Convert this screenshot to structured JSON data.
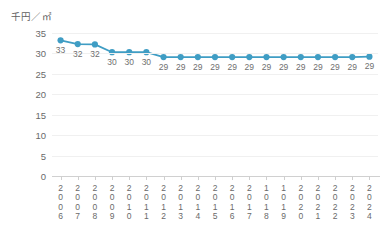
{
  "chart_data": {
    "type": "line",
    "title": "",
    "subtitle": "",
    "ylabel": "千円／㎡",
    "xlabel": "",
    "ylim": [
      0,
      35
    ],
    "yticks": [
      0,
      5,
      10,
      15,
      20,
      25,
      30,
      35
    ],
    "ytick_labels": [
      "0",
      "5",
      "10",
      "15",
      "20",
      "25",
      "30",
      "35"
    ],
    "grid": true,
    "legend": "none",
    "marker": "circle",
    "series_color": "#3f9dc4",
    "categories": [
      "2006",
      "2007",
      "2008",
      "2009",
      "2010",
      "2011",
      "2012",
      "2013",
      "2014",
      "2015",
      "2016",
      "2017",
      "2018",
      "2019",
      "2020",
      "2021",
      "2022",
      "2023",
      "2024"
    ],
    "xtick_labels": [
      "2\n0\n0\n6",
      "2\n0\n0\n7",
      "2\n0\n0\n8",
      "2\n0\n0\n9",
      "2\n0\n1\n0",
      "2\n0\n1\n1",
      "2\n0\n1\n2",
      "2\n0\n1\n3",
      "2\n0\n1\n4",
      "2\n0\n1\n5",
      "2\n0\n1\n6",
      "2\n0\n1\n7",
      "1\n0\n1\n8",
      "1\n0\n1\n9",
      "2\n0\n2\n0",
      "2\n0\n2\n1",
      "2\n0\n2\n2",
      "2\n0\n2\n3",
      "2\n0\n2\n4"
    ],
    "values": [
      33.2,
      32.3,
      32.2,
      30.3,
      30.3,
      30.3,
      29.1,
      29.1,
      29.1,
      29.1,
      29.1,
      29.1,
      29.1,
      29.1,
      29.1,
      29.1,
      29.1,
      29.1,
      29.2
    ],
    "data_labels": [
      "33",
      "32",
      "32",
      "30",
      "30",
      "30",
      "29",
      "29",
      "29",
      "29",
      "29",
      "29",
      "29",
      "29",
      "29",
      "29",
      "29",
      "29",
      "29"
    ]
  }
}
